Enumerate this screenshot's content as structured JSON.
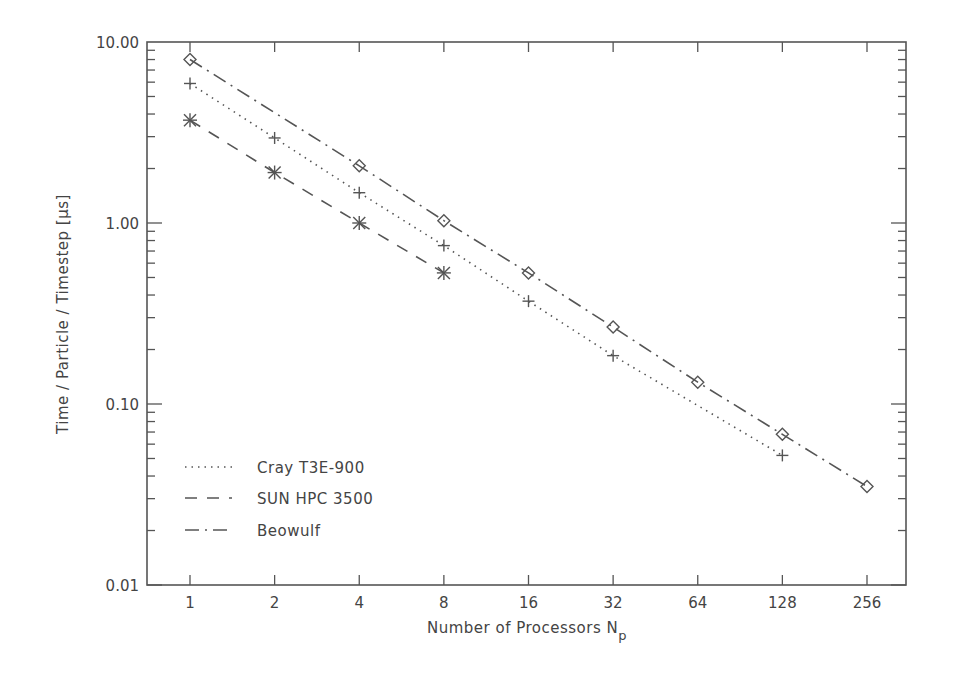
{
  "chart_data": {
    "type": "line",
    "title": "",
    "xlabel": "Number of Processors N",
    "xlabel_subscript": "p",
    "ylabel": "Time / Particle / Timestep [μs]",
    "xscale": "log2",
    "yscale": "log10",
    "xlim": [
      0.75,
      340
    ],
    "ylim": [
      0.01,
      10.0
    ],
    "x_ticks": [
      1,
      2,
      4,
      8,
      16,
      32,
      64,
      128,
      256
    ],
    "x_tick_labels": [
      "1",
      "2",
      "4",
      "8",
      "16",
      "32",
      "64",
      "128",
      "256"
    ],
    "y_ticks": [
      0.01,
      0.1,
      1.0,
      10.0
    ],
    "y_tick_labels": [
      "0.01",
      "0.10",
      "1.00",
      "10.00"
    ],
    "grid": false,
    "legend_position": "lower-left",
    "series": [
      {
        "name": "Cray T3E-900",
        "line_style": "dotted",
        "marker": "plus",
        "x": [
          1,
          2,
          4,
          8,
          16,
          32,
          128
        ],
        "values": [
          5.9,
          2.95,
          1.47,
          0.75,
          0.37,
          0.185,
          0.052
        ]
      },
      {
        "name": "SUN HPC 3500",
        "line_style": "dashed",
        "marker": "asterisk",
        "x": [
          1,
          2,
          4,
          8
        ],
        "values": [
          3.7,
          1.9,
          1.0,
          0.53
        ]
      },
      {
        "name": "Beowulf",
        "line_style": "dash-dot",
        "marker": "diamond",
        "x": [
          1,
          4,
          8,
          16,
          32,
          64,
          128,
          256
        ],
        "values": [
          8.0,
          2.07,
          1.03,
          0.53,
          0.266,
          0.132,
          0.068,
          0.035
        ]
      }
    ]
  },
  "legend": {
    "items": [
      {
        "label": "Cray T3E-900"
      },
      {
        "label": "SUN HPC 3500"
      },
      {
        "label": "Beowulf"
      }
    ]
  },
  "colors": {
    "axis": "#555555",
    "line": "#555555",
    "text": "#444444",
    "background": "#ffffff"
  }
}
